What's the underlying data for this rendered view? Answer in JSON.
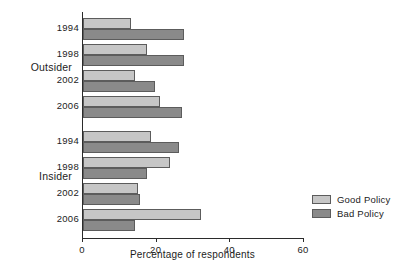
{
  "chart_data": {
    "type": "bar",
    "orientation": "horizontal",
    "title": "",
    "xlabel": "Percentage of respondents",
    "ylabel": "",
    "xlim": [
      0,
      65
    ],
    "xticks": [
      0,
      20,
      40,
      60
    ],
    "xtick_labels": [
      "0",
      "20",
      "40",
      "60"
    ],
    "grid": false,
    "legend_position": "right",
    "groups": [
      {
        "name": "Outsider",
        "categories": [
          "1994",
          "1998",
          "2002",
          "2006"
        ],
        "series": [
          {
            "name": "Good Policy",
            "values": [
              13,
              17.5,
              14,
              21
            ]
          },
          {
            "name": "Bad Policy",
            "values": [
              27.5,
              27.5,
              19.5,
              27
            ]
          }
        ]
      },
      {
        "name": "Insider",
        "categories": [
          "1994",
          "1998",
          "2002",
          "2006"
        ],
        "series": [
          {
            "name": "Good Policy",
            "values": [
              18.5,
              23.5,
              15,
              32
            ]
          },
          {
            "name": "Bad Policy",
            "values": [
              26,
              17.5,
              15.5,
              14
            ]
          }
        ]
      }
    ],
    "series_colors": {
      "Good Policy": "#c6c6c6",
      "Bad Policy": "#8a8a8a"
    }
  },
  "legend": {
    "items": [
      {
        "label": "Good Policy",
        "color": "#c6c6c6"
      },
      {
        "label": "Bad Policy",
        "color": "#8a8a8a"
      }
    ]
  },
  "axis": {
    "x_title": "Percentage of respondents",
    "ticks": [
      "0",
      "20",
      "40",
      "60"
    ]
  },
  "groups_labels": {
    "outsider": "Outsider",
    "insider": "Insider"
  },
  "years": {
    "outsider": [
      "1994",
      "1998",
      "2002",
      "2006"
    ],
    "insider": [
      "1994",
      "1998",
      "2002",
      "2006"
    ]
  }
}
